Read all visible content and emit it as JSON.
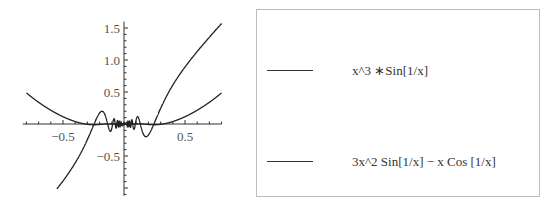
{
  "chart_data": {
    "type": "line",
    "title": "",
    "xlabel": "",
    "ylabel": "",
    "xlim": [
      -0.83,
      0.8
    ],
    "ylim": [
      -1.12,
      1.6
    ],
    "x_ticks": [
      -0.5,
      0.5
    ],
    "x_tick_labels": [
      "−0.5",
      "0.5"
    ],
    "y_ticks": [
      -0.5,
      0.5,
      1.0,
      1.5
    ],
    "y_tick_labels": [
      "−0.5",
      "0.5",
      "1.0",
      "1.5"
    ],
    "grid": false,
    "legend_position": "right (separate box)",
    "series": [
      {
        "name": "x^3 *Sin[1/x]",
        "expr": "x^3*sin(1/x)",
        "x_range": [
          -0.8,
          0.8
        ],
        "sample_points": [
          [
            -0.8,
            0.49
          ],
          [
            -0.5,
            0.11
          ],
          [
            0,
            0
          ],
          [
            0.5,
            0.11
          ],
          [
            0.8,
            0.49
          ]
        ]
      },
      {
        "name": "3x^2 Sin[1/x] − x Cos[1/x]",
        "expr": "3x^2*sin(1/x)-x*cos(1/x)",
        "x_range": [
          -0.55,
          0.8
        ],
        "sample_points": [
          [
            -0.55,
            -1.1
          ],
          [
            -0.2,
            0.2
          ],
          [
            0,
            0
          ],
          [
            0.2,
            -0.2
          ],
          [
            0.5,
            0.89
          ],
          [
            0.8,
            1.57
          ]
        ]
      }
    ]
  },
  "legend": {
    "items": [
      {
        "label": "x^3 ∗Sin[1/x]"
      },
      {
        "label": "3x^2 Sin[1/x] − x Cos [1/x]"
      }
    ]
  }
}
